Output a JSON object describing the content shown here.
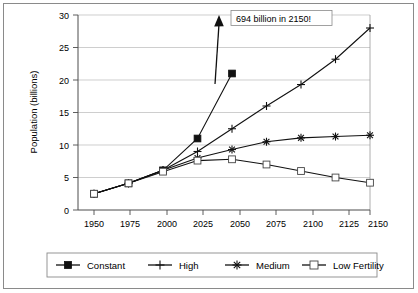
{
  "chart_data": {
    "type": "line",
    "title": "",
    "xlabel": "",
    "ylabel": "Population (billions)",
    "categories": [
      "1950",
      "1975",
      "2000",
      "2025",
      "2050",
      "2075",
      "2100",
      "2125",
      "2150"
    ],
    "x_tick_labels": [
      "1950",
      "1975",
      "2000",
      "2025",
      "2050",
      "2075",
      "2100",
      "2125",
      "2150"
    ],
    "y_tick_labels": [
      "0",
      "5",
      "10",
      "15",
      "20",
      "25",
      "30"
    ],
    "y_ticks": [
      0,
      5,
      10,
      15,
      20,
      25,
      30
    ],
    "ylim": [
      0,
      30
    ],
    "grid": "horizontal",
    "legend_position": "bottom",
    "series": [
      {
        "name": "Constant",
        "marker": "filled-square",
        "values": [
          2.5,
          4.1,
          6.1,
          11.0,
          21.0,
          null,
          null,
          null,
          null
        ]
      },
      {
        "name": "High",
        "marker": "plus",
        "values": [
          2.5,
          4.1,
          6.1,
          9.0,
          12.5,
          16.0,
          19.3,
          23.2,
          28.0
        ]
      },
      {
        "name": "Medium",
        "marker": "asterisk",
        "values": [
          2.5,
          4.1,
          6.1,
          8.0,
          9.3,
          10.5,
          11.1,
          11.3,
          11.5
        ]
      },
      {
        "name": "Low Fertility",
        "marker": "open-square",
        "values": [
          2.5,
          4.1,
          5.9,
          7.6,
          7.8,
          7.0,
          6.0,
          5.0,
          4.2
        ]
      }
    ],
    "annotations": [
      {
        "text": "694 billion in 2150!",
        "note": "arrow pointing up from Constant series 2050 point",
        "value_billions": 694,
        "year": "2150"
      }
    ]
  },
  "legend": {
    "items": [
      {
        "label": "Constant"
      },
      {
        "label": "High"
      },
      {
        "label": "Medium"
      },
      {
        "label": "Low Fertility"
      }
    ]
  },
  "colors": {
    "line": "#111111",
    "grid": "#b9b9b9",
    "frame": "#8a8a8a",
    "background": "#ffffff"
  }
}
